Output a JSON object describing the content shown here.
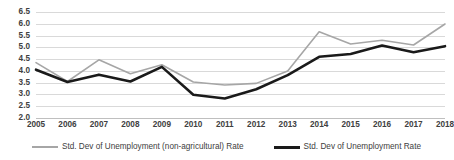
{
  "chart_data": {
    "type": "line",
    "title": "",
    "xlabel": "",
    "ylabel": "",
    "x": [
      2005,
      2006,
      2007,
      2008,
      2009,
      2010,
      2011,
      2012,
      2013,
      2014,
      2015,
      2016,
      2017,
      2018
    ],
    "categories": [
      "2005",
      "2006",
      "2007",
      "2008",
      "2009",
      "2010",
      "2011",
      "2012",
      "2013",
      "2014",
      "2015",
      "2016",
      "2017",
      "2018"
    ],
    "ylim": [
      2.0,
      6.5
    ],
    "yticks": [
      "2.0",
      "2.5",
      "3.0",
      "3.5",
      "4.0",
      "4.5",
      "5.0",
      "5.5",
      "6.0",
      "6.5"
    ],
    "ytick_values": [
      2.0,
      2.5,
      3.0,
      3.5,
      4.0,
      4.5,
      5.0,
      5.5,
      6.0,
      6.5
    ],
    "grid": true,
    "grid_axis": "y",
    "legend_position": "bottom",
    "series": [
      {
        "name": "Std. Dev of Unemployment (non-agricultural) Rate",
        "color": "#a6a6a6",
        "width": 1.6,
        "values": [
          4.35,
          3.55,
          4.47,
          3.88,
          4.26,
          3.53,
          3.4,
          3.47,
          4.0,
          5.66,
          5.14,
          5.3,
          5.1,
          5.99
        ]
      },
      {
        "name": "Std. Dev of Unemployment Rate",
        "color": "#1a1a1a",
        "width": 2.6,
        "values": [
          4.05,
          3.53,
          3.84,
          3.55,
          4.17,
          2.99,
          2.83,
          3.22,
          3.82,
          4.6,
          4.72,
          5.08,
          4.79,
          5.05
        ]
      }
    ]
  },
  "colors": {
    "series_gray": "#a6a6a6",
    "series_black": "#1a1a1a",
    "gridline": "#d9d9d9",
    "axis": "#bfbfbf",
    "text": "#404040",
    "background": "#ffffff"
  },
  "legend": {
    "items": [
      {
        "label": "Std. Dev of Unemployment (non-agricultural) Rate",
        "style": "gray"
      },
      {
        "label": "Std. Dev of Unemployment Rate",
        "style": "black"
      }
    ]
  }
}
